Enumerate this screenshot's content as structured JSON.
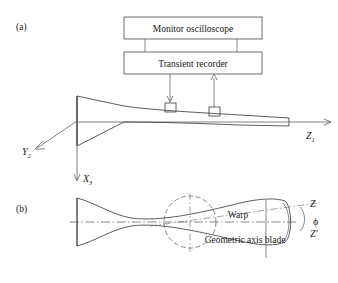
{
  "figure": {
    "panels": [
      {
        "id": "a",
        "label": "(a)"
      },
      {
        "id": "b",
        "label": "(b)"
      }
    ]
  },
  "panel_a": {
    "instruments": [
      {
        "name": "monitor-oscilloscope",
        "label": "Monitor oscilloscope"
      },
      {
        "name": "transient-recorder",
        "label": "Transient recorder"
      }
    ],
    "axes": [
      {
        "name": "y-axis",
        "symbol": "Y",
        "subscript": "2"
      },
      {
        "name": "x-axis",
        "symbol": "X",
        "subscript": "3"
      },
      {
        "name": "z-axis",
        "symbol": "Z",
        "subscript": "1"
      }
    ],
    "sensors": [
      {
        "name": "sensor-excitation",
        "direction": "down"
      },
      {
        "name": "sensor-response",
        "direction": "up"
      }
    ]
  },
  "panel_b": {
    "annotations": [
      {
        "name": "warp-label",
        "label": "Warp"
      },
      {
        "name": "geometric-axis-label",
        "label": "Geometric axis blade"
      }
    ],
    "axis_labels": [
      {
        "name": "z-warp-axis",
        "symbol": "Z",
        "prime": ""
      },
      {
        "name": "z-geometric-axis",
        "symbol": "Z",
        "prime": "′"
      }
    ],
    "angle": {
      "name": "phi-angle",
      "symbol": "ϕ"
    }
  },
  "colors": {
    "background": "#ffffff",
    "stroke": "#333333",
    "text": "#1a1a1a"
  }
}
